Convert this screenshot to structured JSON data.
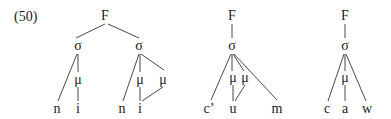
{
  "example_number": "(50)",
  "trees": [
    {
      "name": "tree-1",
      "nodes": [
        {
          "id": "F",
          "label": "F",
          "x": 105,
          "y": 16
        },
        {
          "id": "s1",
          "label": "σ",
          "x": 78,
          "y": 46
        },
        {
          "id": "s2",
          "label": "σ",
          "x": 139,
          "y": 46
        },
        {
          "id": "m1",
          "label": "μ",
          "x": 78,
          "y": 80
        },
        {
          "id": "n1",
          "label": "n",
          "x": 57,
          "y": 109
        },
        {
          "id": "i1",
          "label": "i",
          "x": 78,
          "y": 109
        },
        {
          "id": "m2",
          "label": "μ",
          "x": 140,
          "y": 80
        },
        {
          "id": "m3",
          "label": "μ",
          "x": 163,
          "y": 80
        },
        {
          "id": "n2",
          "label": "n",
          "x": 122,
          "y": 109
        },
        {
          "id": "i2",
          "label": "i",
          "x": 140,
          "y": 109
        }
      ],
      "edges": [
        [
          105,
          24,
          76,
          38
        ],
        [
          108,
          24,
          139,
          38
        ],
        [
          77,
          54,
          58,
          101
        ],
        [
          78,
          54,
          78,
          72
        ],
        [
          78,
          87,
          78,
          101
        ],
        [
          139,
          54,
          123,
          101
        ],
        [
          140,
          54,
          140,
          72
        ],
        [
          141,
          54,
          164,
          70
        ],
        [
          140,
          87,
          140,
          101
        ],
        [
          163,
          87,
          142,
          101
        ]
      ]
    },
    {
      "name": "tree-2",
      "nodes": [
        {
          "id": "F",
          "label": "F",
          "x": 232,
          "y": 16
        },
        {
          "id": "s",
          "label": "σ",
          "x": 232,
          "y": 46
        },
        {
          "id": "m1",
          "label": "μ",
          "x": 233,
          "y": 78
        },
        {
          "id": "m2",
          "label": "μ",
          "x": 245,
          "y": 78
        },
        {
          "id": "c",
          "label": "c’",
          "x": 209,
          "y": 109
        },
        {
          "id": "u",
          "label": "u",
          "x": 233,
          "y": 109
        },
        {
          "id": "m",
          "label": "m",
          "x": 277,
          "y": 109
        }
      ],
      "edges": [
        [
          232,
          24,
          232,
          38
        ],
        [
          231,
          54,
          211,
          100
        ],
        [
          232,
          54,
          232,
          71
        ],
        [
          233,
          54,
          244,
          71
        ],
        [
          234,
          54,
          277,
          100
        ],
        [
          233,
          85,
          233,
          101
        ],
        [
          245,
          85,
          235,
          101
        ]
      ]
    },
    {
      "name": "tree-3",
      "nodes": [
        {
          "id": "F",
          "label": "F",
          "x": 345,
          "y": 16
        },
        {
          "id": "s",
          "label": "σ",
          "x": 345,
          "y": 46
        },
        {
          "id": "m",
          "label": "μ",
          "x": 345,
          "y": 78
        },
        {
          "id": "c",
          "label": "c",
          "x": 327,
          "y": 109
        },
        {
          "id": "a",
          "label": "a",
          "x": 345,
          "y": 109
        },
        {
          "id": "w",
          "label": "w",
          "x": 367,
          "y": 109
        }
      ],
      "edges": [
        [
          345,
          24,
          345,
          38
        ],
        [
          344,
          54,
          328,
          101
        ],
        [
          345,
          54,
          345,
          71
        ],
        [
          346,
          54,
          366,
          101
        ],
        [
          345,
          85,
          345,
          101
        ]
      ]
    }
  ]
}
